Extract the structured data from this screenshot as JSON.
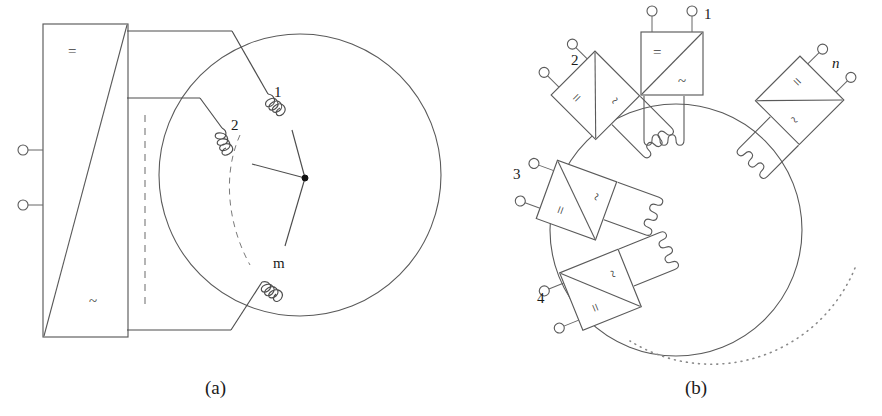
{
  "figure": {
    "captions": [
      {
        "id": "caption-a",
        "text": "(a)"
      },
      {
        "id": "caption-b",
        "text": "(b)"
      }
    ]
  },
  "panel_a": {
    "name": "single-converter-multiphase-machine",
    "converter": {
      "dc_symbol": "=",
      "ac_symbol": "~",
      "terminals": [
        "dc-positive-terminal",
        "dc-negative-terminal"
      ],
      "terminal_count": 2
    },
    "machine": {
      "shape": "circle",
      "winding_labels": [
        "1",
        "2",
        "m"
      ],
      "star_point": "neutral-point",
      "phase_count_label": "m",
      "ellipsis": "vertical-dashed-line"
    }
  },
  "panel_b": {
    "name": "modular-converter-ring-machine",
    "modules": [
      {
        "label": "1",
        "dc_symbol": "=",
        "ac_symbol": "~",
        "terminals": 2
      },
      {
        "label": "2",
        "dc_symbol": "=",
        "ac_symbol": "~",
        "terminals": 2
      },
      {
        "label": "3",
        "dc_symbol": "=",
        "ac_symbol": "~",
        "terminals": 2
      },
      {
        "label": "4",
        "dc_symbol": "=",
        "ac_symbol": "~",
        "terminals": 2
      },
      {
        "label": "n",
        "dc_symbol": "=",
        "ac_symbol": "~",
        "terminals": 2,
        "italic": true
      }
    ],
    "machine": {
      "shape": "circle",
      "continuation": "dotted-arc"
    }
  },
  "style": {
    "line_color": "#5a5a5a",
    "text_color": "#1a1a1a",
    "background": "#ffffff"
  }
}
